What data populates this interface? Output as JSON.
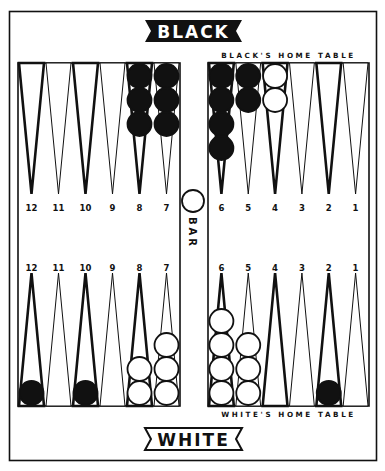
{
  "title_top": "BLACK",
  "title_bottom": "WHITE",
  "black_home_label": "BLACK'S HOME TABLE",
  "white_home_label": "WHITE'S HOME TABLE",
  "bar_label": "BAR",
  "colors": {
    "ink": "#111111",
    "paper": "#ffffff"
  },
  "top_left_points": [
    "12",
    "11",
    "10",
    "9",
    "8",
    "7"
  ],
  "top_right_points": [
    "6",
    "5",
    "4",
    "3",
    "2",
    "1"
  ],
  "bottom_left_points": [
    "12",
    "11",
    "10",
    "9",
    "8",
    "7"
  ],
  "bottom_right_points": [
    "6",
    "5",
    "4",
    "3",
    "2",
    "1"
  ],
  "checkers": {
    "top_left": [
      {
        "point": "8",
        "color": "black",
        "count": 3
      },
      {
        "point": "7",
        "color": "black",
        "count": 3
      }
    ],
    "top_right": [
      {
        "point": "6",
        "color": "black",
        "count": 4
      },
      {
        "point": "5",
        "color": "black",
        "count": 2
      },
      {
        "point": "4",
        "color": "white",
        "count": 2
      }
    ],
    "bottom_left": [
      {
        "point": "12",
        "color": "black",
        "count": 1
      },
      {
        "point": "10",
        "color": "black",
        "count": 1
      },
      {
        "point": "8",
        "color": "white",
        "count": 2
      },
      {
        "point": "7",
        "color": "white",
        "count": 3
      }
    ],
    "bottom_right": [
      {
        "point": "6",
        "color": "white",
        "count": 4
      },
      {
        "point": "5",
        "color": "white",
        "count": 3
      },
      {
        "point": "2",
        "color": "black",
        "count": 1
      }
    ],
    "bar": [
      {
        "color": "white",
        "count": 1
      }
    ]
  }
}
